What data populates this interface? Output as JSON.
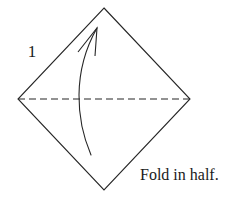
{
  "diagram": {
    "kind": "origami-fold-instruction",
    "step_number": "1",
    "caption": "Fold in half.",
    "background_color": "#ffffff",
    "stroke_color": "#262626",
    "stroke_width": 1.1,
    "shape": {
      "name": "square-rotated-45-diamond",
      "vertices": {
        "top": [
          104,
          8
        ],
        "left": [
          18,
          99
        ],
        "right": [
          190,
          99
        ],
        "bottom": [
          104,
          190
        ]
      },
      "points": "104,8 190,99 104,190 18,99"
    },
    "fold_line": {
      "name": "valley-fold-dashed-line",
      "orientation": "horizontal",
      "from": [
        18,
        99
      ],
      "to": [
        190,
        99
      ],
      "dash_pattern": "7 4",
      "style": "dashed"
    },
    "arrow": {
      "name": "curved-fold-arrow",
      "direction": "bottom-to-top",
      "tail": [
        91,
        155
      ],
      "tip": [
        97,
        28
      ],
      "curve_path": "M 91 155 C 76 120, 72 72, 97 28",
      "head_style": "open-v",
      "head_left_barb": [
        78,
        52
      ],
      "head_right_barb": [
        95,
        56
      ]
    },
    "labels": {
      "step": {
        "text": "1",
        "x": 32,
        "y": 57
      },
      "caption": {
        "text": "Fold in half.",
        "x": 140,
        "y": 180
      }
    }
  }
}
